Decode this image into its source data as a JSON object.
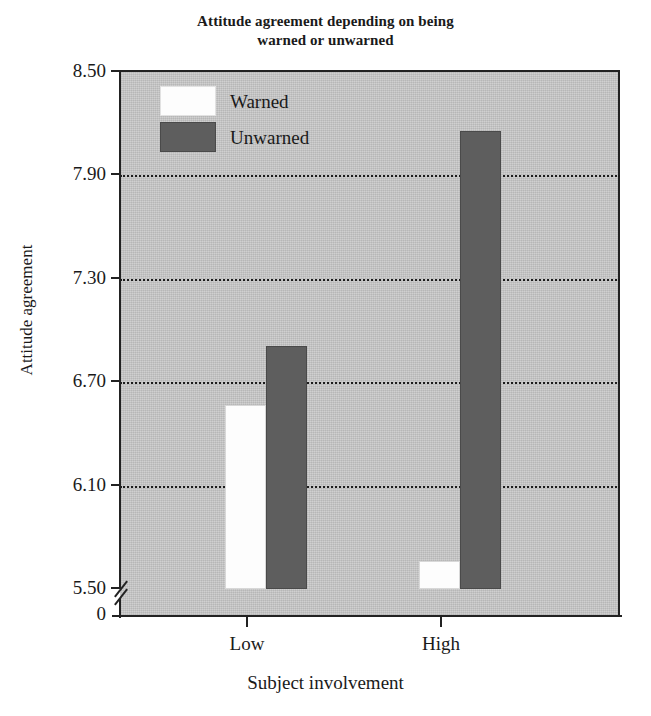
{
  "chart_data": {
    "type": "bar",
    "title": "Attitude agreement depending on being warned or unwarned",
    "title_lines": [
      "Attitude agreement depending on being",
      "warned or unwarned"
    ],
    "xlabel": "Subject involvement",
    "ylabel": "Attitude agreement",
    "categories": [
      "Low",
      "High"
    ],
    "series": [
      {
        "name": "Warned",
        "color": "#fdfdfd",
        "values": [
          6.57,
          5.66
        ]
      },
      {
        "name": "Unwarned",
        "color": "#5e5e5e",
        "values": [
          6.91,
          8.16
        ]
      }
    ],
    "ylim": [
      5.5,
      8.5
    ],
    "y_ticks": [
      "8.50",
      "7.90",
      "7.30",
      "6.70",
      "6.10",
      "5.50",
      "0"
    ],
    "y_tick_values": [
      8.5,
      7.9,
      7.3,
      6.7,
      6.1,
      5.5,
      0
    ],
    "gridlines": [
      7.9,
      7.3,
      6.7,
      6.1
    ],
    "grid": true,
    "axis_break": true,
    "legend_position": "top-left-inside",
    "plot_background": "#c6c6c6"
  },
  "legend": {
    "items": [
      {
        "label": "Warned"
      },
      {
        "label": "Unwarned"
      }
    ]
  },
  "axis": {
    "x_labels": [
      "Low",
      "High"
    ],
    "y_labels": [
      "8.50",
      "7.90",
      "7.30",
      "6.70",
      "6.10",
      "5.50",
      "0"
    ],
    "x_title": "Subject involvement",
    "y_title": "Attitude agreement"
  }
}
